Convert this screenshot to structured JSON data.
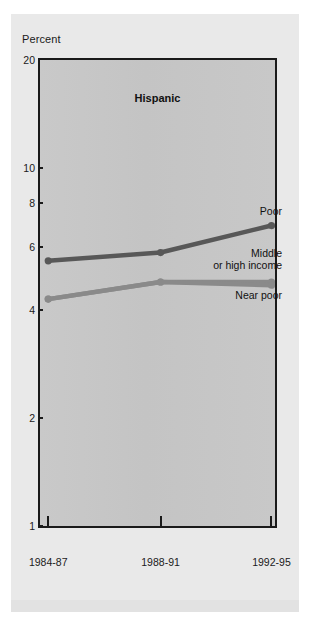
{
  "figure": {
    "top_caption_sliver": "",
    "axis_title": "Percent",
    "chart_title": "Hispanic"
  },
  "chart_data": {
    "type": "line",
    "title": "Hispanic",
    "xlabel": "",
    "ylabel": "Percent",
    "yscale": "log",
    "ylim": [
      1,
      20
    ],
    "grid": false,
    "legend_position": "inline-right-annotations",
    "categories": [
      "1984-87",
      "1988-91",
      "1992-95"
    ],
    "ytick_labels": [
      "20",
      "10",
      "8",
      "6",
      "4",
      "2",
      "1"
    ],
    "ytick_values": [
      20,
      10,
      8,
      6,
      4,
      2,
      1
    ],
    "series": [
      {
        "name": "Poor",
        "color": "#585858",
        "values": [
          5.5,
          5.8,
          6.9
        ]
      },
      {
        "name": "Middle or high income",
        "color": "#8a8a8a",
        "values": [
          4.3,
          4.8,
          4.8
        ]
      },
      {
        "name": "Near poor",
        "color": "#8a8a8a",
        "values": [
          4.3,
          4.8,
          4.7
        ]
      }
    ],
    "annotations": [
      {
        "text": "Poor",
        "series": "Poor"
      },
      {
        "text": "Middle\nor high income",
        "series": "Middle or high income"
      },
      {
        "text": "Near poor",
        "series": "Near poor"
      }
    ]
  },
  "colors": {
    "panel_background": "#e9e9e9",
    "plot_background": "#c6c6c6",
    "axis": "#1a1a1a",
    "series_poor": "#585858",
    "series_near_poor": "#8a8a8a"
  }
}
